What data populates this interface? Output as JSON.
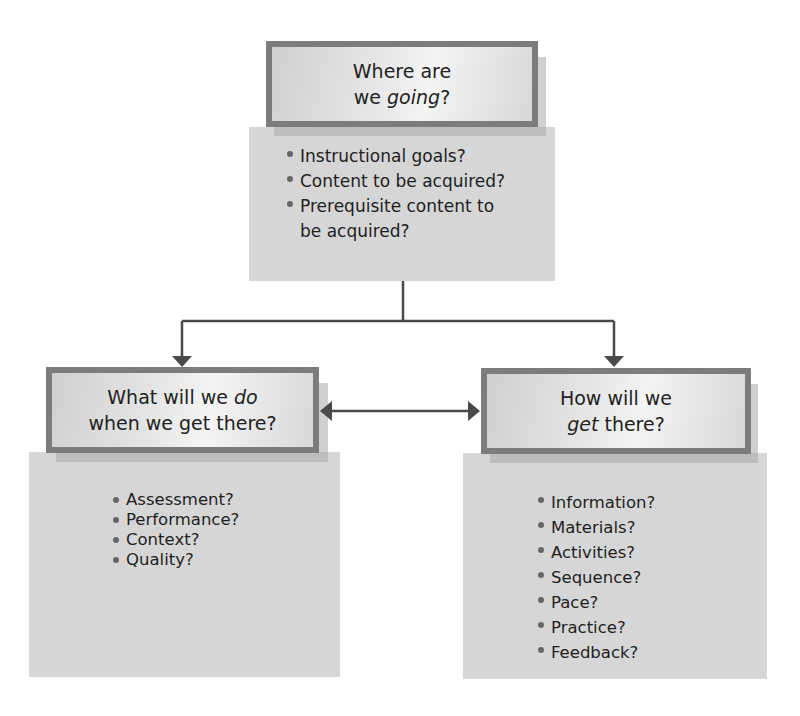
{
  "diagram": {
    "top": {
      "title_line1": "Where are",
      "title_line2_prefix": "we ",
      "title_line2_emph": "going",
      "title_line2_suffix": "?",
      "items": [
        "Instructional goals?",
        "Content to be acquired?",
        "Prerequisite content to be acquired?"
      ],
      "items_display": [
        "Instructional goals?",
        "Content to be acquired?",
        "Prerequisite content to",
        "be acquired?"
      ]
    },
    "left": {
      "title_line1_prefix": "What will we ",
      "title_line1_emph": "do",
      "title_line2": "when we get there?",
      "items": [
        "Assessment?",
        "Performance?",
        "Context?",
        "Quality?"
      ]
    },
    "right": {
      "title_line1": "How will we",
      "title_line2_emph": "get",
      "title_line2_suffix": " there?",
      "items": [
        "Information?",
        "Materials?",
        "Activities?",
        "Sequence?",
        "Pace?",
        "Practice?",
        "Feedback?"
      ]
    },
    "connectors": [
      {
        "from": "top",
        "to": "left",
        "type": "arrow"
      },
      {
        "from": "top",
        "to": "right",
        "type": "arrow"
      },
      {
        "from": "left",
        "to": "right",
        "type": "double-arrow"
      }
    ],
    "colors": {
      "panel": "#d6d6d6",
      "box_border": "#7c7c7c",
      "line": "#4a4a4a",
      "text": "#1e1e1e"
    }
  }
}
